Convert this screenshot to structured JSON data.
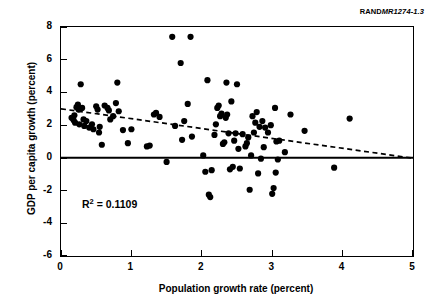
{
  "report_tag": {
    "prefix": "RAND",
    "number": "MR1274-1.3"
  },
  "annotation": {
    "r2_symbol": "R",
    "r2_exponent": "2",
    "r2_text": " = 0.1109"
  },
  "colors": {
    "marker": "#000000",
    "axis": "#000000",
    "trendline": "#000000",
    "background": "#ffffff"
  },
  "chart_data": {
    "type": "scatter",
    "title": "",
    "xlabel": "Population growth rate (percent)",
    "ylabel": "GDP per capita growth (percent)",
    "xlim": [
      0,
      5
    ],
    "ylim": [
      -6,
      8
    ],
    "xticks": [
      0,
      1,
      2,
      3,
      4,
      5
    ],
    "yticks": [
      8,
      6,
      4,
      2,
      0,
      -2,
      -4,
      -6
    ],
    "xtick_labels": [
      "0",
      "1",
      "2",
      "3",
      "4",
      "5"
    ],
    "ytick_labels": [
      "8",
      "6",
      "4",
      "2",
      "0",
      "-2",
      "-4",
      "-6"
    ],
    "grid": false,
    "legend": null,
    "zero_line": {
      "y": 0,
      "style": "solid",
      "width": 2
    },
    "r_squared": 0.1109,
    "trendline": {
      "style": "dashed",
      "x_start": 0.0,
      "y_start": 3.0,
      "x_end": 5.0,
      "y_end": -0.02,
      "slope": -0.604,
      "intercept": 3.0
    },
    "marker_size": 5,
    "points": [
      [
        0.15,
        2.45
      ],
      [
        0.18,
        2.3
      ],
      [
        0.19,
        2.6
      ],
      [
        0.2,
        2.15
      ],
      [
        0.22,
        3.1
      ],
      [
        0.24,
        3.25
      ],
      [
        0.25,
        2.95
      ],
      [
        0.26,
        2.05
      ],
      [
        0.28,
        4.5
      ],
      [
        0.3,
        3.05
      ],
      [
        0.32,
        2.35
      ],
      [
        0.33,
        1.95
      ],
      [
        0.36,
        2.25
      ],
      [
        0.4,
        1.85
      ],
      [
        0.44,
        2.05
      ],
      [
        0.46,
        1.75
      ],
      [
        0.5,
        3.15
      ],
      [
        0.52,
        2.95
      ],
      [
        0.54,
        1.55
      ],
      [
        0.55,
        1.9
      ],
      [
        0.58,
        0.8
      ],
      [
        0.62,
        3.2
      ],
      [
        0.66,
        3.05
      ],
      [
        0.68,
        2.9
      ],
      [
        0.7,
        2.35
      ],
      [
        0.74,
        2.55
      ],
      [
        0.78,
        3.35
      ],
      [
        0.8,
        4.6
      ],
      [
        0.82,
        2.85
      ],
      [
        0.88,
        1.7
      ],
      [
        0.95,
        0.9
      ],
      [
        1.0,
        1.75
      ],
      [
        1.22,
        0.7
      ],
      [
        1.26,
        0.75
      ],
      [
        1.32,
        2.65
      ],
      [
        1.35,
        2.75
      ],
      [
        1.4,
        2.5
      ],
      [
        1.5,
        -0.25
      ],
      [
        1.58,
        7.4
      ],
      [
        1.62,
        1.95
      ],
      [
        1.7,
        5.8
      ],
      [
        1.72,
        1.1
      ],
      [
        1.75,
        2.25
      ],
      [
        1.8,
        3.3
      ],
      [
        1.84,
        7.4
      ],
      [
        1.86,
        1.3
      ],
      [
        2.02,
        0.15
      ],
      [
        2.05,
        -0.85
      ],
      [
        2.08,
        4.75
      ],
      [
        2.1,
        -2.25
      ],
      [
        2.12,
        -2.4
      ],
      [
        2.14,
        -0.75
      ],
      [
        2.18,
        1.4
      ],
      [
        2.2,
        2.05
      ],
      [
        2.22,
        3.05
      ],
      [
        2.24,
        3.2
      ],
      [
        2.26,
        2.55
      ],
      [
        2.28,
        2.7
      ],
      [
        2.3,
        0.85
      ],
      [
        2.32,
        0.95
      ],
      [
        2.34,
        2.45
      ],
      [
        2.35,
        4.6
      ],
      [
        2.36,
        2.65
      ],
      [
        2.38,
        1.5
      ],
      [
        2.4,
        -0.7
      ],
      [
        2.42,
        3.45
      ],
      [
        2.44,
        -0.55
      ],
      [
        2.46,
        1.05
      ],
      [
        2.48,
        1.5
      ],
      [
        2.5,
        4.5
      ],
      [
        2.52,
        0.55
      ],
      [
        2.54,
        -0.65
      ],
      [
        2.58,
        1.45
      ],
      [
        2.62,
        0.7
      ],
      [
        2.64,
        0.9
      ],
      [
        2.66,
        1.25
      ],
      [
        2.68,
        -1.95
      ],
      [
        2.7,
        0.15
      ],
      [
        2.72,
        2.55
      ],
      [
        2.74,
        1.55
      ],
      [
        2.76,
        2.15
      ],
      [
        2.78,
        2.8
      ],
      [
        2.8,
        -0.95
      ],
      [
        2.82,
        1.9
      ],
      [
        2.84,
        -0.05
      ],
      [
        2.86,
        2.25
      ],
      [
        2.88,
        0.65
      ],
      [
        2.9,
        1.85
      ],
      [
        2.94,
        1.55
      ],
      [
        2.98,
        2.0
      ],
      [
        3.0,
        -2.2
      ],
      [
        3.02,
        -1.85
      ],
      [
        3.04,
        3.05
      ],
      [
        3.05,
        -0.9
      ],
      [
        3.06,
        1.0
      ],
      [
        3.08,
        -0.1
      ],
      [
        3.1,
        1.05
      ],
      [
        3.18,
        0.35
      ],
      [
        3.26,
        2.65
      ],
      [
        3.46,
        1.65
      ],
      [
        3.88,
        -0.6
      ],
      [
        4.1,
        2.4
      ]
    ]
  }
}
